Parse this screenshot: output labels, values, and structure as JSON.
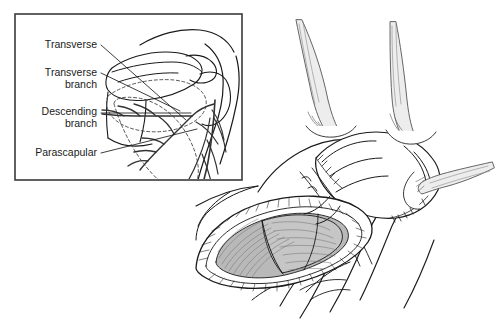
{
  "figure": {
    "background_color": "#ffffff",
    "ink_color": "#1a1a1a",
    "muscle_fill": "#b9b9b9",
    "muscle_fill_light": "#cfcfcf",
    "retractor_fill": "#e8e8e8",
    "width": 500,
    "height": 328
  },
  "inset": {
    "name": "vascular-anatomy-inset",
    "border_color": "#3a3a3a",
    "x": 15,
    "y": 14,
    "width": 227,
    "height": 166,
    "labels": [
      {
        "id": "transverse",
        "text": "Transverse",
        "anchor": "end",
        "x": 97,
        "y": 48
      },
      {
        "id": "transverse-branch-1",
        "text": "Transverse",
        "anchor": "end",
        "x": 97,
        "y": 76
      },
      {
        "id": "transverse-branch-2",
        "text": "branch",
        "anchor": "end",
        "x": 97,
        "y": 88
      },
      {
        "id": "descending-branch-1",
        "text": "Descending",
        "anchor": "end",
        "x": 97,
        "y": 115
      },
      {
        "id": "descending-branch-2",
        "text": "branch",
        "anchor": "end",
        "x": 97,
        "y": 127
      },
      {
        "id": "parascapular",
        "text": "Parascapular",
        "anchor": "end",
        "x": 97,
        "y": 156
      }
    ],
    "leader_lines": [
      {
        "id": "leader-transverse",
        "points": "101,45 186,120"
      },
      {
        "id": "leader-transverse-branch",
        "points": "101,73 178,110"
      },
      {
        "id": "leader-descending-branch",
        "points": "101,113 190,113"
      },
      {
        "id": "leader-parascapular",
        "points": "101,153 196,130"
      }
    ],
    "structures": [
      "scapula-outline",
      "acromion",
      "scapular-spine",
      "humeral-head",
      "dashed-flap-outline-scapular",
      "dashed-flap-outline-parascapular",
      "circumflex-scapular-artery",
      "transverse-branch-vessel",
      "descending-branch-vessel",
      "parascapular-vessel",
      "arm-contour"
    ]
  },
  "main_illustration": {
    "name": "surgical-exposure-illustration",
    "structures": [
      "retractor-left",
      "retractor-middle",
      "retractor-right",
      "skin-flap-elevated",
      "subcutaneous-fat-edge",
      "latissimus-dorsi-muscle",
      "teres-major-muscle",
      "triangular-space",
      "arm-contour",
      "torso-contour",
      "incision-opening"
    ],
    "retractors": [
      {
        "id": "retractor-left",
        "label": "retractor-hook-left"
      },
      {
        "id": "retractor-middle",
        "label": "retractor-hook-middle"
      },
      {
        "id": "retractor-right",
        "label": "retractor-hook-right"
      }
    ]
  }
}
